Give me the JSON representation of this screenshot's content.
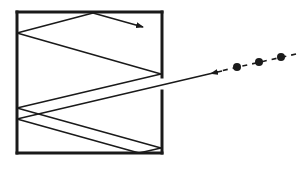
{
  "figure": {
    "box": {
      "x": 17,
      "y": 12,
      "width": 145,
      "height": 141,
      "stroke": "#1a1a1a",
      "stroke_width": 3
    },
    "opening": {
      "wall": "right",
      "y_start": 77,
      "y_end": 91
    },
    "incoming_particles": [
      {
        "cx": 237,
        "cy": 67,
        "r": 4
      },
      {
        "cx": 259,
        "cy": 62,
        "r": 4
      },
      {
        "cx": 281,
        "cy": 57,
        "r": 4
      }
    ],
    "dashed_path": {
      "x1": 296,
      "y1": 54,
      "x2": 216,
      "y2": 72
    },
    "ray_path_points": [
      [
        213,
        73
      ],
      [
        17,
        119
      ],
      [
        139,
        153
      ],
      [
        161,
        148
      ],
      [
        17,
        108
      ],
      [
        161,
        74
      ],
      [
        17,
        33
      ],
      [
        93,
        13
      ],
      [
        142,
        27
      ]
    ],
    "arrow_heads": [
      {
        "at": [
          213,
          73
        ],
        "direction": "left"
      },
      {
        "at": [
          142,
          27
        ],
        "direction": "down-right"
      }
    ],
    "line_color": "#1a1a1a"
  }
}
